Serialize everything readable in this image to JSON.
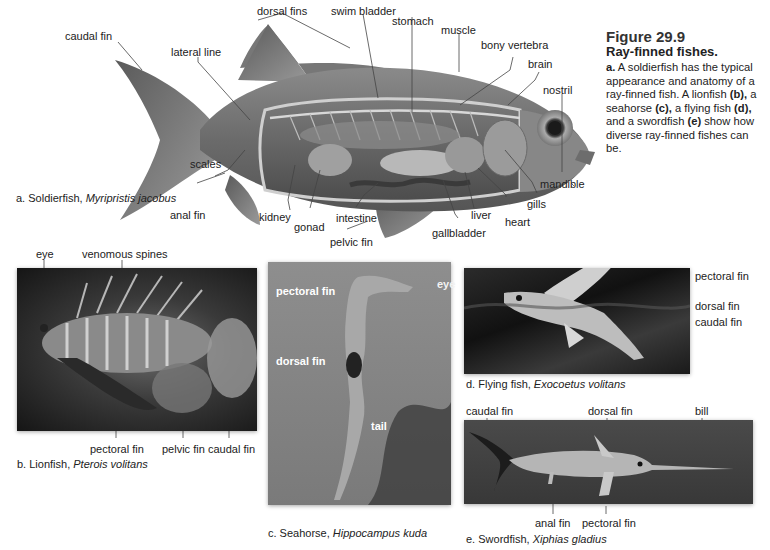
{
  "figure": {
    "number": "Figure 29.9",
    "title": "Ray-finned fishes.",
    "caption_parts": {
      "a_marker": "a.",
      "a_text": " A soldierfish has the typical appearance and anatomy of a ray-finned fish. A lionfish ",
      "b_marker": "(b),",
      "b_text": " a seahorse ",
      "c_marker": "(c),",
      "c_text": " a flying fish ",
      "d_marker": "(d),",
      "d_text": " and a swordfish ",
      "e_marker": "(e)",
      "e_text": " show how diverse ray-finned fishes can be."
    }
  },
  "panel_a": {
    "caption_prefix": "a. Soldierfish, ",
    "caption_species": "Myripristis jacobus",
    "labels": {
      "caudal_fin": "caudal fin",
      "lateral_line": "lateral line",
      "dorsal_fins": "dorsal fins",
      "swim_bladder": "swim bladder",
      "stomach": "stomach",
      "muscle": "muscle",
      "bony_vertebra": "bony vertebra",
      "brain": "brain",
      "nostril": "nostril",
      "mandible": "mandible",
      "gills": "gills",
      "heart": "heart",
      "liver": "liver",
      "gallbladder": "gallbladder",
      "intestine": "intestine",
      "gonad": "gonad",
      "kidney": "kidney",
      "pelvic_fin": "pelvic fin",
      "anal_fin": "anal fin",
      "scales": "scales"
    }
  },
  "panel_b": {
    "caption_prefix": "b. Lionfish, ",
    "caption_species": "Pterois volitans",
    "labels": {
      "eye": "eye",
      "venomous_spines": "venomous spines",
      "pectoral_fin": "pectoral fin",
      "pelvic_fin": "pelvic fin",
      "caudal_fin": "caudal fin"
    }
  },
  "panel_c": {
    "caption_prefix": "c. Seahorse, ",
    "caption_species": "Hippocampus kuda",
    "labels": {
      "pectoral_fin": "pectoral fin",
      "eye": "eye",
      "dorsal_fin": "dorsal fin",
      "tail": "tail"
    }
  },
  "panel_d": {
    "caption_prefix": "d. Flying fish, ",
    "caption_species": "Exocoetus volitans",
    "labels": {
      "pectoral_fin": "pectoral fin",
      "dorsal_fin": "dorsal fin",
      "caudal_fin": "caudal fin"
    }
  },
  "panel_e": {
    "caption_prefix": "e. Swordfish, ",
    "caption_species": "Xiphias gladius",
    "labels": {
      "caudal_fin": "caudal fin",
      "dorsal_fin": "dorsal fin",
      "bill": "bill",
      "anal_fin": "anal fin",
      "pectoral_fin": "pectoral fin"
    }
  }
}
